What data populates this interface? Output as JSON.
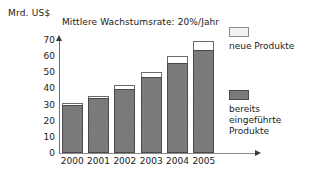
{
  "chart_data": {
    "type": "bar",
    "title": "Mittlere Wachstumsrate: 20%/Jahr",
    "xlabel": "",
    "ylabel": "Mrd. US$",
    "stacked": true,
    "grid": false,
    "legend_position": "right",
    "ylim": [
      0,
      70
    ],
    "yticks": [
      0,
      10,
      20,
      30,
      40,
      50,
      60,
      70
    ],
    "ytick_labels": [
      "0",
      "10",
      "20",
      "30",
      "40",
      "50",
      "60",
      "70"
    ],
    "categories": [
      "2000",
      "2001",
      "2002",
      "2003",
      "2004",
      "2005"
    ],
    "series": [
      {
        "name": "bereits eingeführte Produkte",
        "color": "#777777",
        "values": [
          30,
          34,
          39.5,
          47,
          56,
          64
        ]
      },
      {
        "name": "neue Produkte",
        "color": "#ffffff",
        "values": [
          1,
          1.5,
          2.5,
          3.5,
          4,
          5.5
        ]
      }
    ],
    "totals": [
      31,
      35.5,
      42,
      50.5,
      60,
      69.5
    ]
  },
  "axis": {
    "y_unit_caption": "Mrd. US$"
  },
  "legend": {
    "entries": [
      {
        "label": "neue Produkte",
        "swatch": "light"
      },
      {
        "label": "bereits\neingeführte\nProdukte",
        "swatch": "dark"
      }
    ]
  }
}
